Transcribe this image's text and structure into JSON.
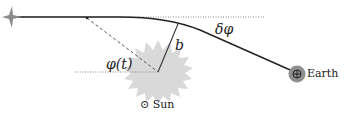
{
  "diagram": {
    "labels": {
      "impact_parameter": "b",
      "deflection_angle": "δφ",
      "angle_over_time": "φ(t)",
      "sun": "Sun",
      "earth": "Earth"
    },
    "symbols": {
      "sun_symbol": "⊙",
      "earth_symbol": "⊕"
    },
    "colors": {
      "line": "#222222",
      "sun_fill": "#d9d9d9",
      "star_fill": "#8c8c8c",
      "earth_fill": "#8f8f8f",
      "dotted": "#888888"
    }
  }
}
